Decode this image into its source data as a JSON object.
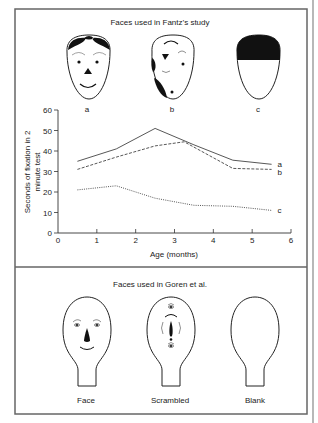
{
  "top_panel": {
    "title": "Faces used in Fantz’s study",
    "faces": [
      {
        "label": "a",
        "type": "schematic-face"
      },
      {
        "label": "b",
        "type": "scrambled-face"
      },
      {
        "label": "c",
        "type": "blank-face-with-hair"
      }
    ]
  },
  "bottom_panel": {
    "title": "Faces used in Goren et al.",
    "faces": [
      {
        "label": "Face",
        "type": "face"
      },
      {
        "label": "Scrambled",
        "type": "scrambled"
      },
      {
        "label": "Blank",
        "type": "blank"
      }
    ]
  },
  "chart_data": {
    "type": "line",
    "title": "",
    "xlabel": "Age (months)",
    "ylabel_line1": "Seconds of fixation in 2",
    "ylabel_line2": "minute test",
    "xlim": [
      0,
      6
    ],
    "ylim": [
      0,
      60
    ],
    "xticks": [
      0,
      1,
      2,
      3,
      4,
      5,
      6
    ],
    "yticks": [
      0,
      10,
      20,
      30,
      40,
      50,
      60
    ],
    "grid": false,
    "legend_position": "inline-right",
    "series": [
      {
        "name": "a",
        "style": "solid",
        "x": [
          0.5,
          1.5,
          2.5,
          3.5,
          4.5,
          5.5
        ],
        "values": [
          35,
          41,
          51,
          43,
          35.5,
          33.5
        ]
      },
      {
        "name": "b",
        "style": "dashed",
        "x": [
          0.5,
          1.5,
          2.5,
          3.25,
          4.5,
          5.5
        ],
        "values": [
          31,
          37,
          42.5,
          44.5,
          31.5,
          31
        ]
      },
      {
        "name": "c",
        "style": "dotted",
        "x": [
          0.5,
          1.5,
          2.5,
          3.5,
          4.5,
          5.5
        ],
        "values": [
          21,
          23,
          17,
          13.5,
          13,
          11
        ]
      }
    ]
  },
  "colors": {
    "ink": "#222222",
    "frame": "#555555",
    "background": "#ffffff"
  }
}
